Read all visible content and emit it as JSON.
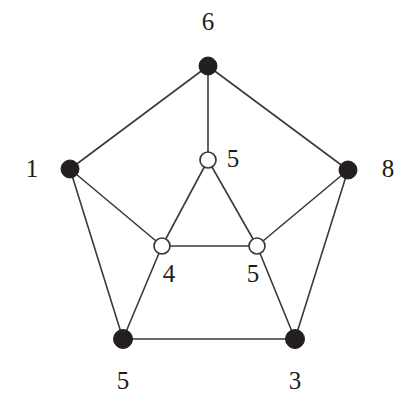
{
  "figure": {
    "kind": "undirected-graph-diagram",
    "background_color": "#ffffff",
    "edge_color": "#3a3a3a",
    "filled_node_color": "#231f20",
    "open_node_fill": "#ffffff",
    "open_node_stroke": "#3a3a3a",
    "label_color": "#1d1d1d",
    "width": 410,
    "height": 417
  },
  "nodes": [
    {
      "id": "n6",
      "label": "6",
      "style": "filled",
      "cx": 208,
      "cy": 66,
      "r": 9,
      "label_x": 208,
      "label_y": 21
    },
    {
      "id": "n1",
      "label": "1",
      "style": "filled",
      "cx": 70,
      "cy": 169,
      "r": 9,
      "label_x": 32,
      "label_y": 168
    },
    {
      "id": "n8",
      "label": "8",
      "style": "filled",
      "cx": 348,
      "cy": 170,
      "r": 9,
      "label_x": 388,
      "label_y": 168
    },
    {
      "id": "w5t",
      "label": "5",
      "style": "open",
      "cx": 208,
      "cy": 160,
      "r": 8,
      "label_x": 233,
      "label_y": 158
    },
    {
      "id": "w4",
      "label": "4",
      "style": "open",
      "cx": 162,
      "cy": 246,
      "r": 8,
      "label_x": 169,
      "label_y": 273
    },
    {
      "id": "w5r",
      "label": "5",
      "style": "open",
      "cx": 257,
      "cy": 246,
      "r": 8,
      "label_x": 253,
      "label_y": 273
    },
    {
      "id": "n5b",
      "label": "5",
      "style": "filled",
      "cx": 123,
      "cy": 339,
      "r": 9.5,
      "label_x": 123,
      "label_y": 380
    },
    {
      "id": "n3",
      "label": "3",
      "style": "filled",
      "cx": 295,
      "cy": 339,
      "r": 9.5,
      "label_x": 295,
      "label_y": 380
    }
  ],
  "edges": [
    {
      "from": "n6",
      "to": "n1"
    },
    {
      "from": "n6",
      "to": "n8"
    },
    {
      "from": "n6",
      "to": "w5t"
    },
    {
      "from": "n1",
      "to": "w4"
    },
    {
      "from": "n1",
      "to": "n5b"
    },
    {
      "from": "n8",
      "to": "w5r"
    },
    {
      "from": "n8",
      "to": "n3"
    },
    {
      "from": "w5t",
      "to": "w4"
    },
    {
      "from": "w5t",
      "to": "w5r"
    },
    {
      "from": "w4",
      "to": "w5r"
    },
    {
      "from": "w4",
      "to": "n5b"
    },
    {
      "from": "w5r",
      "to": "n3"
    },
    {
      "from": "n5b",
      "to": "n3"
    }
  ]
}
